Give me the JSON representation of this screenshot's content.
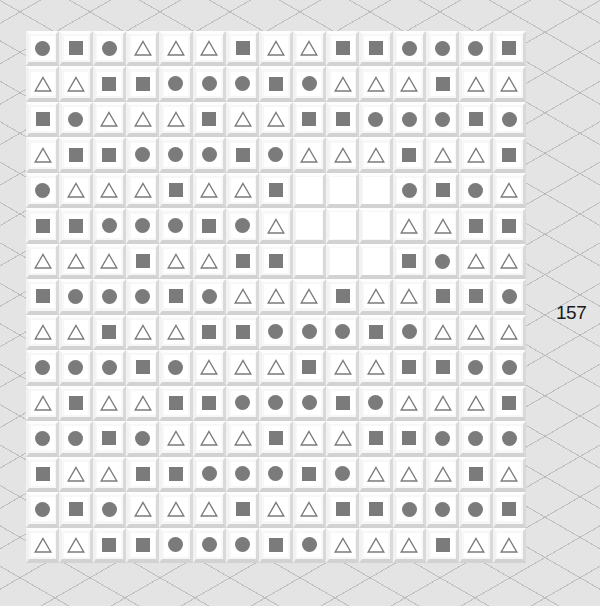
{
  "game": {
    "counter": "157",
    "shape_color": "#7b7b7b",
    "legend": {
      "C": "circle",
      "S": "square",
      "T": "triangle",
      "E": "empty"
    },
    "grid": [
      [
        "C",
        "S",
        "C",
        "T",
        "T",
        "T",
        "S",
        "T",
        "T",
        "S",
        "S",
        "C",
        "C",
        "C",
        "S"
      ],
      [
        "T",
        "T",
        "S",
        "S",
        "C",
        "C",
        "C",
        "S",
        "C",
        "T",
        "T",
        "T",
        "S",
        "T",
        "T"
      ],
      [
        "S",
        "C",
        "T",
        "T",
        "T",
        "S",
        "T",
        "T",
        "S",
        "S",
        "C",
        "C",
        "C",
        "S",
        "C"
      ],
      [
        "T",
        "S",
        "S",
        "C",
        "C",
        "C",
        "S",
        "C",
        "T",
        "T",
        "T",
        "S",
        "T",
        "T",
        "S"
      ],
      [
        "C",
        "T",
        "T",
        "T",
        "S",
        "T",
        "T",
        "S",
        "E",
        "E",
        "E",
        "C",
        "S",
        "C",
        "T"
      ],
      [
        "S",
        "S",
        "C",
        "C",
        "C",
        "S",
        "C",
        "T",
        "E",
        "E",
        "E",
        "T",
        "T",
        "S",
        "S"
      ],
      [
        "T",
        "T",
        "T",
        "S",
        "T",
        "T",
        "S",
        "S",
        "E",
        "E",
        "E",
        "S",
        "C",
        "T",
        "T"
      ],
      [
        "S",
        "C",
        "C",
        "C",
        "S",
        "C",
        "T",
        "T",
        "T",
        "S",
        "T",
        "T",
        "S",
        "S",
        "C"
      ],
      [
        "T",
        "T",
        "S",
        "T",
        "T",
        "S",
        "S",
        "C",
        "C",
        "C",
        "S",
        "C",
        "T",
        "T",
        "T"
      ],
      [
        "C",
        "C",
        "C",
        "S",
        "C",
        "T",
        "T",
        "T",
        "S",
        "T",
        "T",
        "S",
        "S",
        "C",
        "C"
      ],
      [
        "T",
        "S",
        "T",
        "T",
        "S",
        "S",
        "C",
        "C",
        "C",
        "S",
        "C",
        "T",
        "T",
        "T",
        "S"
      ],
      [
        "C",
        "C",
        "S",
        "C",
        "T",
        "T",
        "T",
        "S",
        "T",
        "T",
        "S",
        "S",
        "C",
        "C",
        "C"
      ],
      [
        "S",
        "T",
        "T",
        "S",
        "S",
        "C",
        "C",
        "C",
        "S",
        "C",
        "T",
        "T",
        "T",
        "S",
        "T"
      ],
      [
        "C",
        "S",
        "C",
        "T",
        "T",
        "T",
        "S",
        "T",
        "T",
        "S",
        "S",
        "C",
        "C",
        "C",
        "S"
      ],
      [
        "T",
        "T",
        "S",
        "S",
        "C",
        "C",
        "C",
        "S",
        "C",
        "T",
        "T",
        "T",
        "S",
        "T",
        "T"
      ]
    ]
  }
}
